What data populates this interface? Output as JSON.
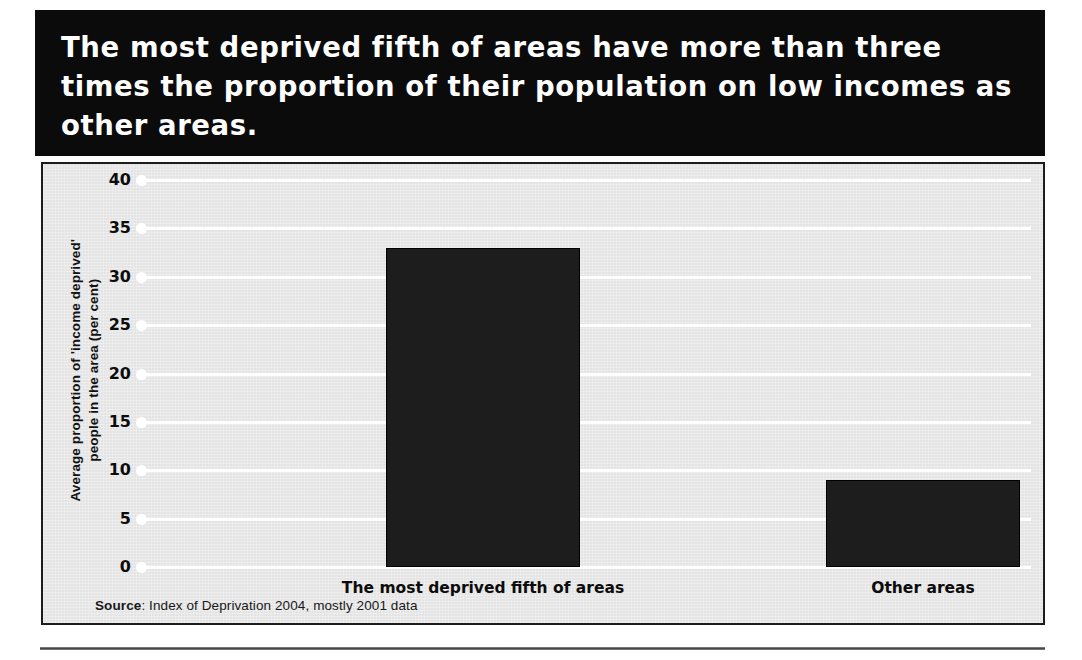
{
  "headline": "The most deprived fifth of areas have more than three times the proportion of their population on low incomes as other areas.",
  "source": {
    "label": "Source",
    "separator": ": ",
    "text": "Index of Deprivation 2004, mostly 2001 data"
  },
  "chart_data": {
    "type": "bar",
    "title": "The most deprived fifth of areas have more than three times the proportion of their population on low incomes as other areas.",
    "categories": [
      "The most deprived fifth of areas",
      "Other areas"
    ],
    "values": [
      33,
      9
    ],
    "xlabel": "",
    "ylabel": "Average proportion of 'income deprived' people in the area (per cent)",
    "ylabel_line1": "Average proportion of 'income deprived'",
    "ylabel_line2": "people in the area (per cent)",
    "ylim": [
      0,
      40
    ],
    "yticks": [
      0,
      5,
      10,
      15,
      20,
      25,
      30,
      35,
      40
    ],
    "ytick_labels": [
      "0",
      "5",
      "10",
      "15",
      "20",
      "25",
      "30",
      "35",
      "40"
    ],
    "grid": true,
    "grid_color": "#ffffff",
    "legend": false,
    "bar_color": "#1d1d1d",
    "plot_background": "#e4e4e4",
    "source": "Source: Index of Deprivation 2004, mostly 2001 data"
  },
  "colors": {
    "headline_background": "#0b0b0b",
    "headline_text": "#ffffff",
    "panel_background": "#e4e4e4",
    "panel_border": "#1c1c1c",
    "bar": "#1d1d1d",
    "gridline": "#ffffff",
    "tick_text": "#0c0c0c"
  }
}
